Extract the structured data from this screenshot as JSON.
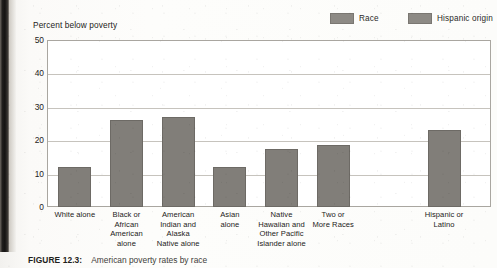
{
  "figure": {
    "caption_number": "FIGURE 12.3:",
    "caption_text": "American poverty rates by race"
  },
  "legend": {
    "items": [
      {
        "label": "Race",
        "color": "#8d8a85",
        "icon": "legend-swatch-icon"
      },
      {
        "label": "Hispanic origin",
        "color": "#8d8a85",
        "icon": "legend-swatch-icon"
      }
    ]
  },
  "chart_data": {
    "type": "bar",
    "title": "American poverty rates by race",
    "ylabel": "Percent below poverty",
    "xlabel": "",
    "ylim": [
      0,
      50
    ],
    "yticks": [
      0,
      10,
      20,
      30,
      40,
      50
    ],
    "ytick_labels": [
      "0",
      "10",
      "20",
      "30",
      "40",
      "50"
    ],
    "grid": true,
    "legend_position": "top-right",
    "categories": [
      "White alone",
      "Black or African American alone",
      "American Indian and Alaska Native alone",
      "Asian alone",
      "Native Hawaiian and Other Pacific Islander alone",
      "Two or More Races",
      "Hispanic or Latino"
    ],
    "category_lines": [
      [
        "White alone"
      ],
      [
        "Black or",
        "African",
        "American",
        "alone"
      ],
      [
        "American",
        "Indian and",
        "Alaska",
        "Native alone"
      ],
      [
        "Asian",
        "alone"
      ],
      [
        "Native",
        "Hawaiian and",
        "Other Pacific",
        "Islander alone"
      ],
      [
        "Two or",
        "More Races"
      ],
      [
        "Hispanic or",
        "Latino"
      ]
    ],
    "series": [
      {
        "name": "Race",
        "values": [
          12,
          26,
          27,
          12,
          17.5,
          18.5,
          null
        ]
      },
      {
        "name": "Hispanic origin",
        "values": [
          null,
          null,
          null,
          null,
          null,
          null,
          23
        ]
      }
    ],
    "values": [
      12,
      26,
      27,
      12,
      17.5,
      18.5,
      23
    ],
    "bar_color": "#817e79"
  }
}
